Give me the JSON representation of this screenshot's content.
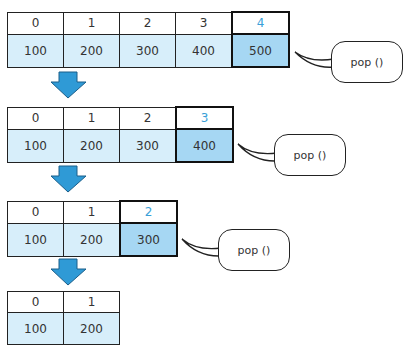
{
  "steps": [
    {
      "indices": [
        "0",
        "1",
        "2",
        "3",
        "4"
      ],
      "values": [
        "100",
        "200",
        "300",
        "400",
        "500"
      ],
      "action": "pop ()"
    },
    {
      "indices": [
        "0",
        "1",
        "2",
        "3"
      ],
      "values": [
        "100",
        "200",
        "300",
        "400"
      ],
      "action": "pop ()"
    },
    {
      "indices": [
        "0",
        "1",
        "2"
      ],
      "values": [
        "100",
        "200",
        "300"
      ],
      "action": "pop ()"
    },
    {
      "indices": [
        "0",
        "1"
      ],
      "values": [
        "100",
        "200"
      ]
    }
  ],
  "colors": {
    "cell_fill": "#d7eefa",
    "highlight_fill": "#a6d7f3",
    "highlight_index_text": "#3a9fd8",
    "arrow": "#2f9ad6"
  }
}
